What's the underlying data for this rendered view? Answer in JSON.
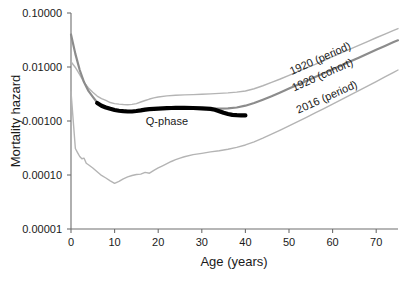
{
  "chart_data": {
    "type": "line",
    "title": "",
    "xlabel": "Age (years)",
    "ylabel": "Mortality hazard",
    "xlim": [
      0,
      75
    ],
    "ylim": [
      1e-05,
      0.1
    ],
    "yscale": "log",
    "grid": false,
    "legend_position": "inline-right",
    "xticks": [
      0,
      10,
      20,
      30,
      40,
      50,
      60,
      70
    ],
    "xtick_labels": [
      "0",
      "10",
      "20",
      "30",
      "40",
      "50",
      "60",
      "70"
    ],
    "yticks": [
      0.1,
      0.01,
      0.001,
      0.0001,
      1e-05
    ],
    "ytick_labels": [
      "0.10000",
      "0.01000",
      "0.00100",
      "0.00010",
      "0.00001"
    ],
    "annotations": [
      {
        "text": "Q-phase",
        "x": 22,
        "y": 0.00085,
        "name": "q-phase-annotation"
      }
    ],
    "series": [
      {
        "name": "1920 (period)",
        "label": "1920 (period)",
        "color": "#b4b4b4",
        "width": 1.4,
        "label_x": 57.5,
        "label_y": 0.0125,
        "label_rotation": -24,
        "x": [
          0,
          1,
          2,
          3,
          4,
          5,
          6,
          7,
          8,
          9,
          10,
          11,
          12,
          13,
          14,
          15,
          16,
          17,
          18,
          19,
          20,
          22,
          24,
          26,
          28,
          30,
          32,
          34,
          36,
          38,
          40,
          42,
          44,
          46,
          48,
          50,
          52,
          54,
          56,
          58,
          60,
          62,
          64,
          66,
          68,
          70,
          72,
          74,
          75
        ],
        "y": [
          0.0125,
          0.0098,
          0.0072,
          0.0052,
          0.0041,
          0.0034,
          0.0029,
          0.0026,
          0.0024,
          0.0022,
          0.0021,
          0.00205,
          0.00202,
          0.002,
          0.00203,
          0.0021,
          0.00225,
          0.0024,
          0.00255,
          0.00268,
          0.00278,
          0.00292,
          0.003,
          0.00305,
          0.00308,
          0.00312,
          0.00318,
          0.00325,
          0.00332,
          0.00342,
          0.0036,
          0.00395,
          0.0045,
          0.0052,
          0.006,
          0.007,
          0.0082,
          0.0096,
          0.0112,
          0.0132,
          0.0155,
          0.0182,
          0.0215,
          0.0252,
          0.0296,
          0.0348,
          0.0408,
          0.0478,
          0.0515
        ]
      },
      {
        "name": "1920 (cohort)",
        "label": "1920 (cohort)",
        "color": "#8c8c8c",
        "width": 2.2,
        "label_x": 58,
        "label_y": 0.0062,
        "label_rotation": -24,
        "x": [
          0,
          1,
          2,
          3,
          4,
          5,
          6,
          7,
          8,
          9,
          10,
          12,
          14,
          16,
          18,
          20,
          22,
          24,
          26,
          28,
          30,
          32,
          34,
          36,
          38,
          40,
          42,
          44,
          46,
          48,
          50,
          52,
          54,
          56,
          58,
          60,
          62,
          64,
          66,
          68,
          70,
          72,
          74,
          75
        ],
        "y": [
          0.04,
          0.0175,
          0.0088,
          0.0052,
          0.0036,
          0.0028,
          0.0022,
          0.00192,
          0.00178,
          0.00168,
          0.0016,
          0.00152,
          0.0015,
          0.00155,
          0.00162,
          0.00168,
          0.00172,
          0.00174,
          0.00175,
          0.00174,
          0.00172,
          0.0017,
          0.0017,
          0.00172,
          0.00178,
          0.00192,
          0.00215,
          0.00248,
          0.00288,
          0.00338,
          0.00398,
          0.00468,
          0.00552,
          0.0065,
          0.00768,
          0.00906,
          0.0107,
          0.0126,
          0.0149,
          0.0176,
          0.0208,
          0.0246,
          0.029,
          0.0312
        ]
      },
      {
        "name": "2016 (period)",
        "label": "2016 (period)",
        "color": "#b4b4b4",
        "width": 1.4,
        "label_x": 59,
        "label_y": 0.0024,
        "label_rotation": -24,
        "x": [
          0,
          1,
          1.5,
          2,
          2.5,
          3,
          3.5,
          4,
          5,
          6,
          7,
          8,
          9,
          10,
          11,
          12,
          13,
          14,
          15,
          16,
          17,
          18,
          19,
          20,
          21,
          22,
          23,
          24,
          25,
          26,
          28,
          30,
          32,
          34,
          36,
          38,
          40,
          42,
          44,
          46,
          48,
          50,
          52,
          54,
          56,
          58,
          60,
          62,
          64,
          66,
          68,
          70,
          72,
          74,
          75
        ],
        "y": [
          0.0035,
          0.00031,
          0.00026,
          0.00022,
          0.0002,
          0.000205,
          0.000165,
          0.000155,
          0.000135,
          0.000115,
          9.8e-05,
          8.8e-05,
          7.8e-05,
          7e-05,
          7.6e-05,
          8.5e-05,
          9.2e-05,
          9.8e-05,
          0.000102,
          0.000104,
          0.000112,
          0.000108,
          0.000122,
          0.000135,
          0.000148,
          0.000162,
          0.000178,
          0.000192,
          0.000205,
          0.000218,
          0.000238,
          0.000252,
          0.000268,
          0.000282,
          0.0003,
          0.000325,
          0.00036,
          0.000412,
          0.000482,
          0.00057,
          0.00068,
          0.000815,
          0.000975,
          0.00117,
          0.00141,
          0.0017,
          0.00205,
          0.00248,
          0.003,
          0.00364,
          0.00442,
          0.00538,
          0.00655,
          0.00798,
          0.0088
        ]
      },
      {
        "name": "Q-phase",
        "label": "Q-phase",
        "color": "#000000",
        "width": 4.2,
        "x": [
          6,
          7,
          8,
          9,
          10,
          11,
          12,
          13,
          14,
          15,
          16,
          17,
          18,
          19,
          20,
          21,
          22,
          23,
          24,
          26,
          28,
          30,
          31,
          32,
          33,
          34,
          35,
          36,
          37,
          38,
          39,
          40
        ],
        "y": [
          0.00215,
          0.00192,
          0.00178,
          0.00168,
          0.0016,
          0.00155,
          0.00152,
          0.0015,
          0.0015,
          0.00153,
          0.00157,
          0.00162,
          0.00166,
          0.00168,
          0.0017,
          0.00172,
          0.00173,
          0.00174,
          0.00175,
          0.00175,
          0.00174,
          0.00172,
          0.0017,
          0.00168,
          0.00162,
          0.00152,
          0.00142,
          0.00135,
          0.0013,
          0.00128,
          0.00127,
          0.00127
        ]
      }
    ]
  },
  "axes": {
    "y_title": "Mortality hazard",
    "x_title": "Age (years)"
  }
}
